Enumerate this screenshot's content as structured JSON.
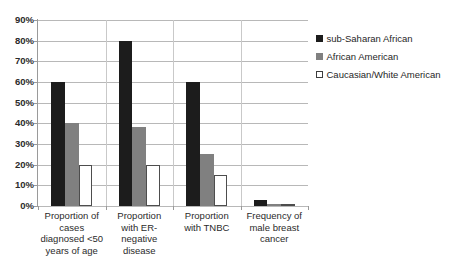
{
  "chart_data": {
    "type": "bar",
    "title": "",
    "subtitle": "",
    "xlabel": "",
    "ylabel": "",
    "ylim": [
      0,
      90
    ],
    "ytick_labels": [
      "0%",
      "10%",
      "20%",
      "30%",
      "40%",
      "50%",
      "60%",
      "70%",
      "80%",
      "90%"
    ],
    "ytick_values": [
      0,
      10,
      20,
      30,
      40,
      50,
      60,
      70,
      80,
      90
    ],
    "grid": true,
    "legend_position": "right",
    "orientation": "vertical",
    "categories": [
      "Proportion of cases diagnosed <50 years of age",
      "Proportion with ER-negative disease",
      "Proportion with TNBC",
      "Frequency of male breast cancer"
    ],
    "category_lines": [
      [
        "Proportion of",
        "cases",
        "diagnosed <50",
        "years of age"
      ],
      [
        "Proportion",
        "with ER-",
        "negative",
        "disease"
      ],
      [
        "Proportion",
        "with TNBC"
      ],
      [
        "Frequency of",
        "male breast",
        "cancer"
      ]
    ],
    "series": [
      {
        "name": "sub-Saharan African",
        "color": "#1c1c1c",
        "swatch": "filled-black-square",
        "values": [
          60,
          80,
          60,
          3
        ]
      },
      {
        "name": "African American",
        "color": "#808080",
        "swatch": "filled-gray-square",
        "values": [
          40,
          38,
          25,
          1
        ]
      },
      {
        "name": "Caucasian/White American",
        "color": "#ffffff",
        "swatch": "outlined-white-square",
        "values": [
          20,
          20,
          15,
          1
        ]
      }
    ],
    "value_suffix": "%"
  },
  "legend": {
    "items": [
      {
        "label": "sub-Saharan African",
        "swatch_class": "s0"
      },
      {
        "label": "African American",
        "swatch_class": "s1"
      },
      {
        "label": "Caucasian/White American",
        "swatch_class": "s2"
      }
    ]
  },
  "colors": {
    "series_1": "#1c1c1c",
    "series_2": "#808080",
    "series_3": "#ffffff",
    "gridline": "#b8b8b8",
    "axis": "#9a9a9a",
    "text": "#2b2b2b",
    "background": "#ffffff"
  }
}
